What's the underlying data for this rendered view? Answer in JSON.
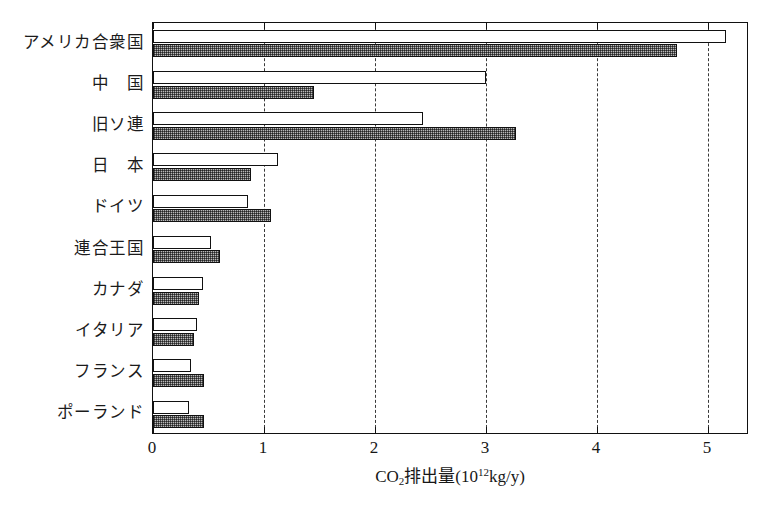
{
  "chart_data": {
    "type": "bar",
    "orientation": "horizontal",
    "title": "",
    "xlabel": "CO2排出量(10^12 kg/y)",
    "xlabel_parts": {
      "prefix": "CO",
      "sub": "2",
      "middle": "排出量(10",
      "sup": "12",
      "suffix": "kg/y)"
    },
    "ylabel": "",
    "xlim": [
      0,
      5.37
    ],
    "ylim": [
      0,
      10
    ],
    "grid": "vertical-dashed",
    "legend": "none",
    "xticks": [
      "0",
      "1",
      "2",
      "3",
      "4",
      "5"
    ],
    "xtick_values": [
      0,
      1,
      2,
      3,
      4,
      5
    ],
    "categories": [
      "アメリカ合衆国",
      "中　国",
      "旧ソ連",
      "日　本",
      "ドイツ",
      "連合王国",
      "カナダ",
      "イタリア",
      "フランス",
      "ポーランド"
    ],
    "series": [
      {
        "name": "open",
        "style": "white-outline",
        "values": [
          5.16,
          3.0,
          2.43,
          1.13,
          0.86,
          0.52,
          0.45,
          0.4,
          0.34,
          0.32
        ]
      },
      {
        "name": "hatched",
        "style": "gray-hatched",
        "values": [
          4.72,
          1.45,
          3.27,
          0.88,
          1.06,
          0.6,
          0.41,
          0.37,
          0.46,
          0.46
        ]
      }
    ],
    "colors": {
      "axis": "#111111",
      "grid": "#3a3a3a",
      "open_bar_fill": "#ffffff",
      "hatched_bar_fill": "#b9b9b9",
      "background": "#ffffff"
    }
  }
}
